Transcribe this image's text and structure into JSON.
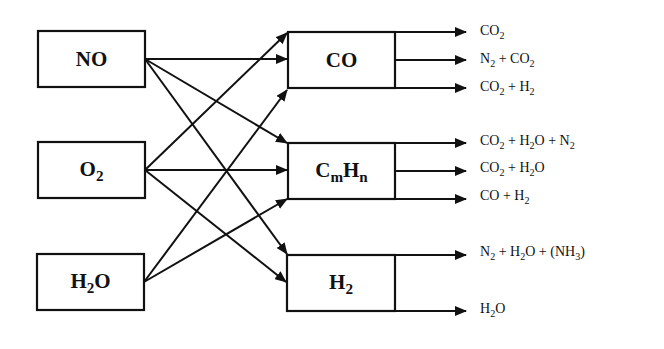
{
  "diagram": {
    "reactants": [
      {
        "id": "NO",
        "label": "NO",
        "html": "NO"
      },
      {
        "id": "O2",
        "label": "O2",
        "html": "O<sub>2</sub>"
      },
      {
        "id": "H2O",
        "label": "H2O",
        "html": "H<sub>2</sub>O"
      }
    ],
    "reductants": [
      {
        "id": "CO",
        "label": "CO",
        "html": "CO",
        "products": [
          {
            "label": "CO2",
            "html": "CO<sub>2</sub>"
          },
          {
            "label": "N2 + CO2",
            "html": "N<sub>2</sub> + CO<sub>2</sub>"
          },
          {
            "label": "CO2 + H2",
            "html": "CO<sub>2</sub> + H<sub>2</sub>"
          }
        ]
      },
      {
        "id": "CmHn",
        "label": "CmHn",
        "html": "C<sub>m</sub>H<sub>n</sub>",
        "products": [
          {
            "label": "CO2 + H2O + N2",
            "html": "CO<sub>2</sub> + H<sub>2</sub>O + N<sub>2</sub>"
          },
          {
            "label": "CO2 + H2O",
            "html": "CO<sub>2</sub> + H<sub>2</sub>O"
          },
          {
            "label": "CO + H2",
            "html": "CO + H<sub>2</sub>"
          }
        ]
      },
      {
        "id": "H2",
        "label": "H2",
        "html": "H<sub>2</sub>",
        "products": [
          {
            "label": "N2 + H2O + (NH3)",
            "html": "N<sub>2</sub> + H<sub>2</sub>O + (NH<sub>3</sub>)"
          },
          {
            "label": "H2O",
            "html": "H<sub>2</sub>O"
          }
        ]
      }
    ],
    "edges": [
      [
        "NO",
        "CO"
      ],
      [
        "NO",
        "CmHn"
      ],
      [
        "NO",
        "H2"
      ],
      [
        "O2",
        "CO"
      ],
      [
        "O2",
        "CmHn"
      ],
      [
        "O2",
        "H2"
      ],
      [
        "H2O",
        "CO"
      ],
      [
        "H2O",
        "CmHn"
      ]
    ],
    "line_color": "#111111"
  }
}
